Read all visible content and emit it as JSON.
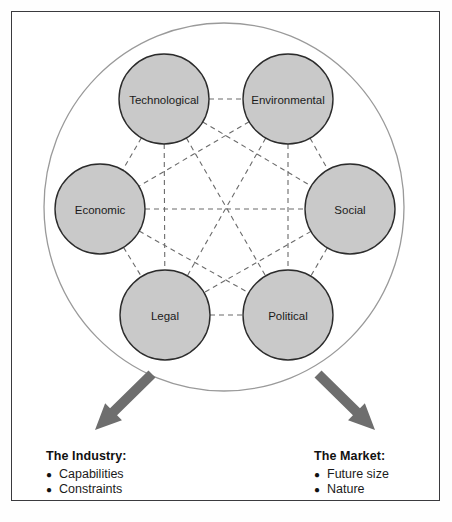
{
  "diagram": {
    "type": "pestel-network",
    "title": "",
    "outer_ellipse": {
      "cx": 224,
      "cy": 207,
      "rx": 180,
      "ry": 184,
      "stroke": "#9a9a9a"
    },
    "node_fill": "#c9c9c9",
    "node_stroke": "#2b2b2b",
    "link_style": "dashed",
    "link_color": "#6b6b6b",
    "arrow_color": "#6e6e6e",
    "nodes": [
      {
        "id": "technological",
        "label": "Technological",
        "cx": 164,
        "cy": 99,
        "r": 45
      },
      {
        "id": "environmental",
        "label": "Environmental",
        "cx": 288,
        "cy": 99,
        "r": 45
      },
      {
        "id": "economic",
        "label": "Economic",
        "cx": 100,
        "cy": 209,
        "r": 45
      },
      {
        "id": "social",
        "label": "Social",
        "cx": 350,
        "cy": 209,
        "r": 45
      },
      {
        "id": "legal",
        "label": "Legal",
        "cx": 165,
        "cy": 315,
        "r": 45
      },
      {
        "id": "political",
        "label": "Political",
        "cx": 288,
        "cy": 315,
        "r": 45
      }
    ],
    "links": [
      [
        "technological",
        "environmental"
      ],
      [
        "technological",
        "economic"
      ],
      [
        "technological",
        "social"
      ],
      [
        "technological",
        "legal"
      ],
      [
        "technological",
        "political"
      ],
      [
        "environmental",
        "economic"
      ],
      [
        "environmental",
        "social"
      ],
      [
        "environmental",
        "legal"
      ],
      [
        "environmental",
        "political"
      ],
      [
        "economic",
        "social"
      ],
      [
        "economic",
        "legal"
      ],
      [
        "economic",
        "political"
      ],
      [
        "social",
        "legal"
      ],
      [
        "social",
        "political"
      ],
      [
        "legal",
        "political"
      ]
    ],
    "arrows": [
      {
        "id": "arrow-to-industry",
        "label": "down-left-arrow",
        "x1": 152,
        "y1": 374,
        "x2": 95,
        "y2": 430
      },
      {
        "id": "arrow-to-market",
        "label": "down-right-arrow",
        "x1": 318,
        "y1": 374,
        "x2": 375,
        "y2": 430
      }
    ]
  },
  "callouts": {
    "industry": {
      "title": "The Industry:",
      "items": [
        {
          "bullet": "●",
          "text": "Capabilities"
        },
        {
          "bullet": "●",
          "text": "Constraints"
        }
      ]
    },
    "market": {
      "title": "The Market:",
      "items": [
        {
          "bullet": "●",
          "text": "Future size"
        },
        {
          "bullet": "●",
          "text": "Nature"
        }
      ]
    }
  }
}
